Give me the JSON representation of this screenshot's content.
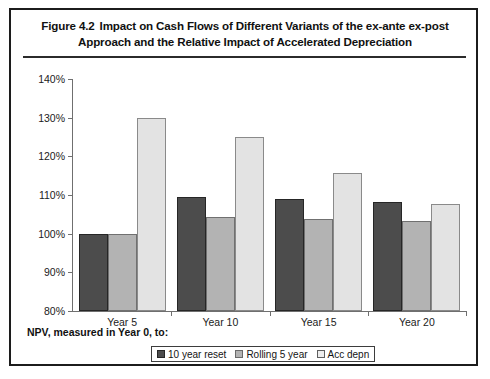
{
  "figure": {
    "label": "Figure 4.2",
    "title_line1": "Impact on Cash Flows of Different Variants of the ex-ante ex-post",
    "title_line2": "Approach and the Relative Impact of Accelerated Depreciation",
    "axis_note": "NPV, measured in Year 0, to:"
  },
  "colors": {
    "series0": "#4c4c4c",
    "series1": "#b3b3b3",
    "series2": "#e3e3e3",
    "frame": "#1c1c1c",
    "axis": "#6f6f6f"
  },
  "chart_data": {
    "type": "bar",
    "title": "Impact on Cash Flows of Different Variants of the ex-ante ex-post Approach and the Relative Impact of Accelerated Depreciation",
    "xlabel": "NPV, measured in Year 0, to:",
    "ylabel": "",
    "categories": [
      "Year 5",
      "Year 10",
      "Year 15",
      "Year 20"
    ],
    "series": [
      {
        "name": "10 year reset",
        "values": [
          100,
          109.5,
          109,
          108.3
        ]
      },
      {
        "name": "Rolling 5 year",
        "values": [
          100,
          104.3,
          103.7,
          103.3
        ]
      },
      {
        "name": "Acc depn",
        "values": [
          130,
          125,
          115.6,
          107.8
        ]
      }
    ],
    "ylim": [
      80,
      140
    ],
    "yticks": [
      80,
      90,
      100,
      110,
      120,
      130,
      140
    ],
    "ytick_labels": [
      "80%",
      "90%",
      "100%",
      "110%",
      "120%",
      "130%",
      "140%"
    ],
    "grid": false,
    "legend_position": "bottom"
  }
}
